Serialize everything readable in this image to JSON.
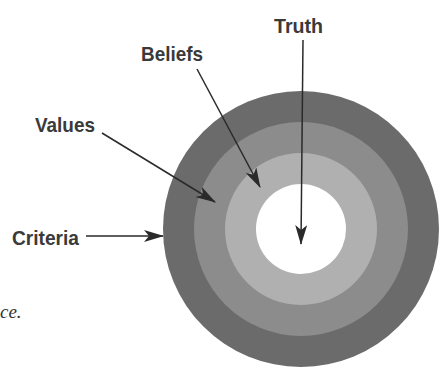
{
  "diagram": {
    "type": "concentric-circles",
    "rings": [
      {
        "name": "Criteria",
        "color": "#6b6b6b"
      },
      {
        "name": "Values",
        "color": "#8c8c8c"
      },
      {
        "name": "Beliefs",
        "color": "#b0b0b0"
      },
      {
        "name": "Truth",
        "color": "#ffffff"
      }
    ],
    "labels": {
      "truth": "Truth",
      "beliefs": "Beliefs",
      "values": "Values",
      "criteria": "Criteria"
    },
    "arrow_color": "#2a2a2a",
    "text_fragment": "ce."
  }
}
